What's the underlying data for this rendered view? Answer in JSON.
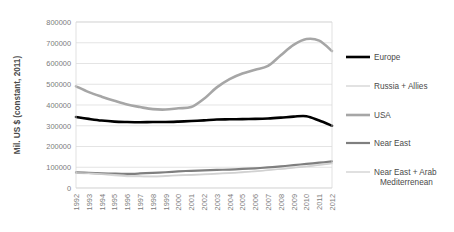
{
  "chart_data": {
    "type": "line",
    "title": "",
    "xlabel": "",
    "ylabel": "Mil. US $ (constant, 2011)",
    "ylim": [
      0,
      800000
    ],
    "ytick_step": 100000,
    "yticks": [
      "800000",
      "700000",
      "600000",
      "500000",
      "400000",
      "300000",
      "200000",
      "100000",
      "0"
    ],
    "grid": true,
    "legend_position": "right",
    "categories": [
      "1992",
      "1993",
      "1994",
      "1995",
      "1996",
      "1997",
      "1998",
      "1999",
      "2000",
      "2001",
      "2002",
      "2003",
      "2004",
      "2005",
      "2006",
      "2007",
      "2008",
      "2009",
      "2010",
      "2011",
      "2012"
    ],
    "series": [
      {
        "name": "Europe",
        "color": "#000000",
        "width": 2.6,
        "values": [
          342000,
          333000,
          325000,
          320000,
          318000,
          317000,
          318000,
          318000,
          320000,
          323000,
          326000,
          330000,
          331000,
          332000,
          333000,
          335000,
          339000,
          344000,
          346000,
          325000,
          300000
        ]
      },
      {
        "name": "Russia + Allies",
        "color": "#d9d9d9",
        "width": 1.5,
        "values": [
          72000,
          70000,
          66000,
          60000,
          56000,
          55000,
          54000,
          57000,
          60000,
          62000,
          65000,
          68000,
          71000,
          75000,
          80000,
          86000,
          92000,
          99000,
          105000,
          112000,
          120000
        ]
      },
      {
        "name": "USA",
        "color": "#a6a6a6",
        "width": 2.6,
        "values": [
          490000,
          462000,
          440000,
          420000,
          402000,
          390000,
          380000,
          378000,
          384000,
          390000,
          430000,
          485000,
          525000,
          552000,
          570000,
          588000,
          640000,
          690000,
          718000,
          710000,
          660000
        ]
      },
      {
        "name": "Near East",
        "color": "#7f7f7f",
        "width": 2.2,
        "values": [
          75000,
          73000,
          71000,
          69000,
          68000,
          70000,
          73000,
          76000,
          80000,
          83000,
          85000,
          87000,
          89000,
          92000,
          95000,
          99000,
          104000,
          110000,
          116000,
          122000,
          128000
        ]
      },
      {
        "name": "Near East + Arab Mediterrenean",
        "color": "#d0d0d0",
        "width": 1.3,
        "values": [
          73000,
          71000,
          68000,
          64000,
          60000,
          58000,
          57000,
          59000,
          62000,
          64000,
          67000,
          70000,
          73000,
          77000,
          81000,
          86000,
          91000,
          97000,
          103000,
          110000,
          117000
        ]
      }
    ]
  },
  "legend": {
    "items": [
      {
        "label": "Europe"
      },
      {
        "label": "Russia + Allies"
      },
      {
        "label": "USA"
      },
      {
        "label": "Near East"
      },
      {
        "label": "Near East + Arab"
      },
      {
        "label": "Mediterrenean"
      }
    ]
  }
}
